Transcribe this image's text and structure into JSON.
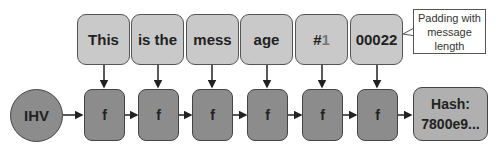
{
  "blocks": [
    {
      "text": "This"
    },
    {
      "text": "is the"
    },
    {
      "text": "mess"
    },
    {
      "text": "age"
    },
    {
      "text": "#",
      "suffix": "1"
    },
    {
      "text": "00022"
    }
  ],
  "ihv": {
    "label": "IHV"
  },
  "functions": [
    {
      "label": "f"
    },
    {
      "label": "f"
    },
    {
      "label": "f"
    },
    {
      "label": "f"
    },
    {
      "label": "f"
    },
    {
      "label": "f"
    }
  ],
  "hash": {
    "line1": "Hash:",
    "line2": "7800e9..."
  },
  "note": {
    "line1": "Padding with",
    "line2": "message",
    "line3": "length"
  }
}
